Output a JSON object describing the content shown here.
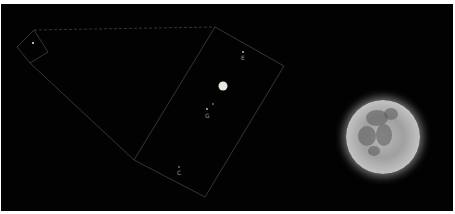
{
  "scene": {
    "background": "#020202",
    "jupiter": {
      "label": "",
      "x": 223,
      "y": 86
    },
    "moons": [
      {
        "label": "E",
        "x": 243,
        "y": 55
      },
      {
        "label": "G",
        "x": 208,
        "y": 116
      },
      {
        "label": "I",
        "x": 213,
        "y": 110
      },
      {
        "label": "C",
        "x": 179,
        "y": 172
      }
    ],
    "inset_star": {
      "x": 33,
      "y": 43
    },
    "outline_color": "#4a4a4a",
    "moon_glow_color": "#ffffff"
  }
}
